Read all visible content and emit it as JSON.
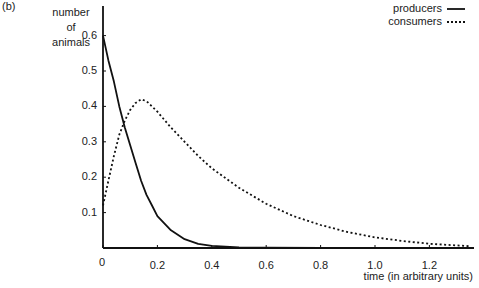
{
  "panel_label": "(b)",
  "chart_data": {
    "type": "line",
    "title": "",
    "ylabel": [
      "number",
      "of",
      "animals"
    ],
    "xlabel": "time (in arbitrary units)",
    "xlim": [
      0,
      1.35
    ],
    "ylim": [
      0,
      0.67
    ],
    "grid": false,
    "legend_position": "top-right",
    "xticks": [
      "0",
      "0.2",
      "0.4",
      "0.6",
      "0.8",
      "1.0",
      "1.2"
    ],
    "yticks": [
      "0.1",
      "0.2",
      "0.3",
      "0.4",
      "0.5",
      "0.6"
    ],
    "series": [
      {
        "name": "producers",
        "style": "solid",
        "x": [
          0,
          0.02,
          0.04,
          0.06,
          0.08,
          0.1,
          0.12,
          0.14,
          0.16,
          0.18,
          0.2,
          0.25,
          0.3,
          0.35,
          0.4,
          0.5,
          0.6,
          0.8,
          1.0,
          1.2,
          1.35
        ],
        "y": [
          0.6,
          0.53,
          0.47,
          0.4,
          0.34,
          0.29,
          0.24,
          0.19,
          0.15,
          0.12,
          0.09,
          0.05,
          0.025,
          0.012,
          0.006,
          0.002,
          0.001,
          0.0,
          0.0,
          0.0,
          0.0
        ]
      },
      {
        "name": "consumers",
        "style": "dotted",
        "x": [
          0,
          0.02,
          0.04,
          0.06,
          0.08,
          0.1,
          0.12,
          0.14,
          0.16,
          0.18,
          0.2,
          0.25,
          0.3,
          0.35,
          0.4,
          0.5,
          0.6,
          0.7,
          0.8,
          0.9,
          1.0,
          1.1,
          1.2,
          1.35
        ],
        "y": [
          0.12,
          0.19,
          0.26,
          0.32,
          0.36,
          0.39,
          0.41,
          0.42,
          0.415,
          0.4,
          0.385,
          0.34,
          0.3,
          0.26,
          0.225,
          0.17,
          0.125,
          0.09,
          0.065,
          0.045,
          0.03,
          0.02,
          0.012,
          0.005
        ]
      }
    ]
  },
  "legend": [
    {
      "label": "producers",
      "style": "solid"
    },
    {
      "label": "consumers",
      "style": "dotted"
    }
  ]
}
